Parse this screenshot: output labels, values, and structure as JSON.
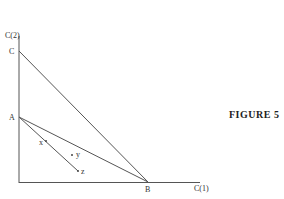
{
  "figure": {
    "caption": "FIGURE 5",
    "axes": {
      "x_label": "C(1)",
      "y_label": "C(2)"
    },
    "points": {
      "A": "A",
      "B": "B",
      "C": "C",
      "x": "x",
      "y": "y",
      "z": "z"
    },
    "colors": {
      "line": "#555555",
      "text": "#333333"
    }
  }
}
